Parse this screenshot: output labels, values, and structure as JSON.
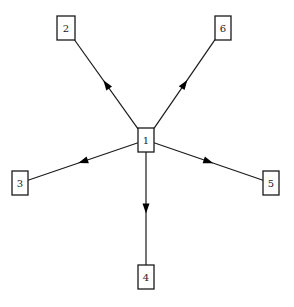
{
  "diagram": {
    "type": "directed-graph",
    "layout": "star",
    "nodes": [
      {
        "id": "1",
        "label": "1",
        "x": 146,
        "y": 140,
        "w": 16,
        "h": 24
      },
      {
        "id": "2",
        "label": "2",
        "x": 66,
        "y": 28,
        "w": 18,
        "h": 24
      },
      {
        "id": "6",
        "label": "6",
        "x": 223,
        "y": 28,
        "w": 16,
        "h": 24
      },
      {
        "id": "3",
        "label": "3",
        "x": 20,
        "y": 183,
        "w": 16,
        "h": 24
      },
      {
        "id": "5",
        "label": "5",
        "x": 271,
        "y": 183,
        "w": 16,
        "h": 24
      },
      {
        "id": "4",
        "label": "4",
        "x": 146,
        "y": 277,
        "w": 16,
        "h": 24
      }
    ],
    "edges": [
      {
        "from": "1",
        "to": "2"
      },
      {
        "from": "1",
        "to": "6"
      },
      {
        "from": "1",
        "to": "3"
      },
      {
        "from": "1",
        "to": "5"
      },
      {
        "from": "1",
        "to": "4"
      }
    ],
    "colors": {
      "stroke": "#1a1a1a",
      "fill": "#ffffff",
      "text": "#222222"
    }
  }
}
